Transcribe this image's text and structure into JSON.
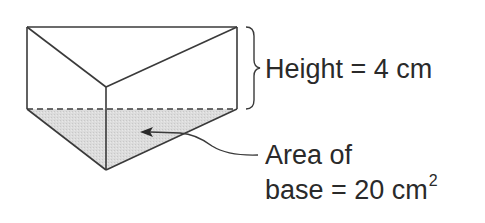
{
  "diagram": {
    "shape": "triangular-prism",
    "colors": {
      "stroke": "#3a3a3a",
      "base_fill": "#d9d9d9",
      "text": "#2a2a2a",
      "background": "#ffffff"
    },
    "labels": {
      "height": "Height = 4 cm",
      "area_line1": "Area of",
      "area_line2": "base = 20 cm",
      "area_exponent": "2"
    },
    "values": {
      "height_cm": 4,
      "base_area_cm2": 20
    }
  }
}
